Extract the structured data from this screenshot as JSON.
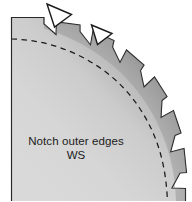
{
  "figure": {
    "name": "notched-saw-blade-quadrant",
    "caption": {
      "line1": "Notch outer edges",
      "line2": "WS"
    },
    "colors": {
      "background": "#ffffff",
      "blade_light": "#dcdcdc",
      "blade_mid": "#c6c6c6",
      "blade_dark": "#6e6e6e",
      "blade_darkest": "#4f4f4f",
      "outline": "#1c1c1c",
      "dashed_arc": "#1a1a1a",
      "arrow_fill": "#ffffff",
      "arrow_stroke": "#1c1c1c",
      "text": "#1b1b1b"
    },
    "elements": {
      "disc_label": "saw blade quadrant body",
      "teeth_label": "notched outer edge teeth",
      "tooth_count": 12,
      "dashed_arc_label": "notch root reference circle",
      "arrow_1_label": "notch callout arrow upper-left",
      "arrow_2_label": "notch callout arrow upper-middle"
    }
  }
}
